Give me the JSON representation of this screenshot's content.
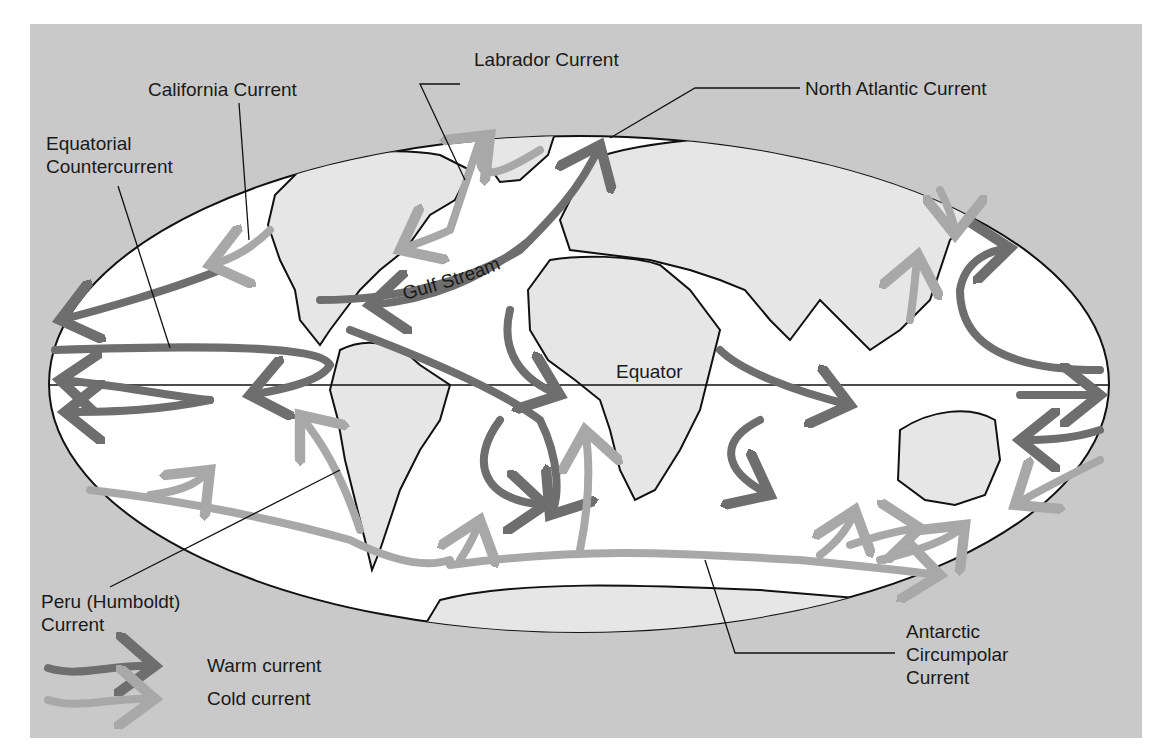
{
  "colors": {
    "background_panel": "#c9c9c9",
    "ocean": "#ffffff",
    "land": "#e6e6e6",
    "warm_current": "#6e6e6e",
    "cold_current": "#a8a8a8",
    "outline": "#111111"
  },
  "labels": {
    "california": "California Current",
    "labrador": "Labrador Current",
    "north_atlantic": "North Atlantic Current",
    "equatorial_counter_line1": "Equatorial",
    "equatorial_counter_line2": "Countercurrent",
    "gulf_stream": "Gulf Stream",
    "equator": "Equator",
    "peru_line1": "Peru (Humboldt)",
    "peru_line2": "Current",
    "antarctic_line1": "Antarctic",
    "antarctic_line2": "Circumpolar",
    "antarctic_line3": "Current"
  },
  "legend": {
    "items": [
      {
        "label": "Warm current",
        "icon": "warm-current-arrow-icon",
        "color": "#6e6e6e"
      },
      {
        "label": "Cold current",
        "icon": "cold-current-arrow-icon",
        "color": "#a8a8a8"
      }
    ]
  }
}
